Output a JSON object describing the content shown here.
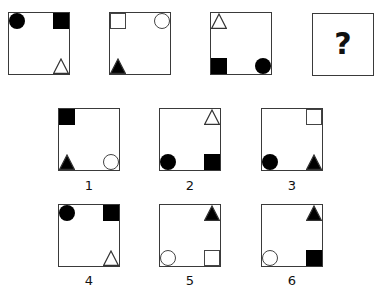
{
  "puzzle": {
    "sequence": [
      {
        "shapes": [
          {
            "type": "circle",
            "fill": "filled",
            "pos": "tl"
          },
          {
            "type": "square",
            "fill": "filled",
            "pos": "trc"
          },
          {
            "type": "triangle",
            "fill": "outline",
            "pos": "br"
          }
        ]
      },
      {
        "shapes": [
          {
            "type": "square",
            "fill": "outline",
            "pos": "tl"
          },
          {
            "type": "circle",
            "fill": "outline",
            "pos": "trc"
          },
          {
            "type": "triangle",
            "fill": "filled",
            "pos": "bl"
          }
        ]
      },
      {
        "shapes": [
          {
            "type": "triangle",
            "fill": "outline",
            "pos": "tl"
          },
          {
            "type": "square",
            "fill": "filled",
            "pos": "bl"
          },
          {
            "type": "circle",
            "fill": "filled",
            "pos": "br"
          }
        ]
      }
    ],
    "question_mark": "?",
    "options": [
      {
        "label": "1",
        "shapes": [
          {
            "type": "square",
            "fill": "filled",
            "pos": "tl"
          },
          {
            "type": "triangle",
            "fill": "filled",
            "pos": "bl"
          },
          {
            "type": "circle",
            "fill": "outline",
            "pos": "br"
          }
        ]
      },
      {
        "label": "2",
        "shapes": [
          {
            "type": "triangle",
            "fill": "outline",
            "pos": "trc"
          },
          {
            "type": "circle",
            "fill": "filled",
            "pos": "bl"
          },
          {
            "type": "square",
            "fill": "filled",
            "pos": "br"
          }
        ]
      },
      {
        "label": "3",
        "shapes": [
          {
            "type": "square",
            "fill": "outline",
            "pos": "trc"
          },
          {
            "type": "circle",
            "fill": "filled",
            "pos": "bl"
          },
          {
            "type": "triangle",
            "fill": "filled",
            "pos": "br"
          }
        ]
      },
      {
        "label": "4",
        "shapes": [
          {
            "type": "circle",
            "fill": "filled",
            "pos": "tl"
          },
          {
            "type": "square",
            "fill": "filled",
            "pos": "trc"
          },
          {
            "type": "triangle",
            "fill": "outline",
            "pos": "br"
          }
        ]
      },
      {
        "label": "5",
        "shapes": [
          {
            "type": "triangle",
            "fill": "filled",
            "pos": "trc"
          },
          {
            "type": "circle",
            "fill": "outline",
            "pos": "bl"
          },
          {
            "type": "square",
            "fill": "outline",
            "pos": "br"
          }
        ]
      },
      {
        "label": "6",
        "shapes": [
          {
            "type": "triangle",
            "fill": "filled",
            "pos": "trc"
          },
          {
            "type": "circle",
            "fill": "outline",
            "pos": "bl"
          },
          {
            "type": "square",
            "fill": "filled",
            "pos": "br"
          }
        ]
      }
    ]
  }
}
